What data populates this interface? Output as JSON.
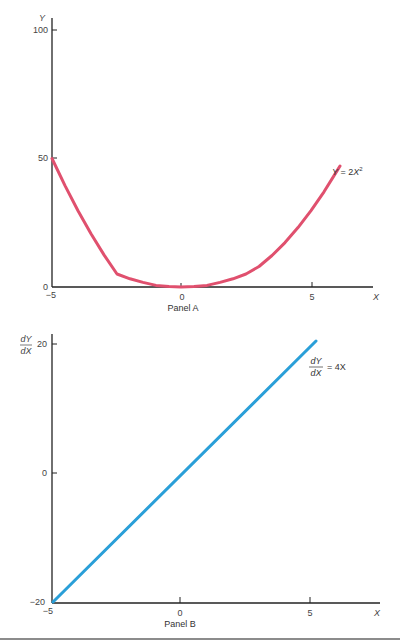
{
  "colors": {
    "panel_a_curve": "#e0506e",
    "panel_b_line": "#2a9fd8",
    "axis": "#222222"
  },
  "panel_a": {
    "label": "Panel A",
    "y_axis_name": "Y",
    "x_axis_name": "X",
    "y_ticks": [
      "100",
      "50",
      "0"
    ],
    "x_ticks": [
      "−5",
      "0",
      "5"
    ],
    "equation": {
      "lhs": "Y",
      "eq": " = 2",
      "var": "X",
      "sup": "2"
    }
  },
  "panel_b": {
    "label": "Panel B",
    "y_axis_name_num": "dY",
    "y_axis_name_den": "dX",
    "x_axis_name": "X",
    "y_ticks": [
      "20",
      "0",
      "−20"
    ],
    "x_ticks": [
      "−5",
      "0",
      "5"
    ],
    "equation": {
      "num": "dY",
      "den": "dX",
      "rhs": "= 4X"
    }
  },
  "chart_data": [
    {
      "type": "line",
      "title": "Panel A",
      "xlabel": "X",
      "ylabel": "Y",
      "xlim": [
        -5,
        7
      ],
      "ylim": [
        0,
        100
      ],
      "x_ticks": [
        -5,
        0,
        5
      ],
      "y_ticks": [
        0,
        50,
        100
      ],
      "grid": false,
      "series": [
        {
          "name": "Y = 2X^2",
          "function": "Y = 2X^2",
          "x": [
            -5,
            -4,
            -3,
            -2,
            -1,
            0,
            1,
            2,
            3,
            4,
            5,
            6,
            6.3
          ],
          "y": [
            50,
            32,
            18,
            8,
            2,
            0,
            2,
            8,
            18,
            32,
            50,
            72,
            79.4
          ]
        }
      ],
      "annotations": [
        "Y = 2X²"
      ]
    },
    {
      "type": "line",
      "title": "Panel B",
      "xlabel": "X",
      "ylabel": "dY/dX",
      "xlim": [
        -5,
        7
      ],
      "ylim": [
        -20,
        20
      ],
      "x_ticks": [
        -5,
        0,
        5
      ],
      "y_ticks": [
        -20,
        0,
        20
      ],
      "grid": false,
      "series": [
        {
          "name": "dY/dX = 4X",
          "function": "dY/dX = 4X",
          "x": [
            -5,
            0,
            5,
            5.2
          ],
          "y": [
            -20,
            0,
            20,
            20.8
          ]
        }
      ],
      "annotations": [
        "dY/dX = 4X"
      ]
    }
  ]
}
